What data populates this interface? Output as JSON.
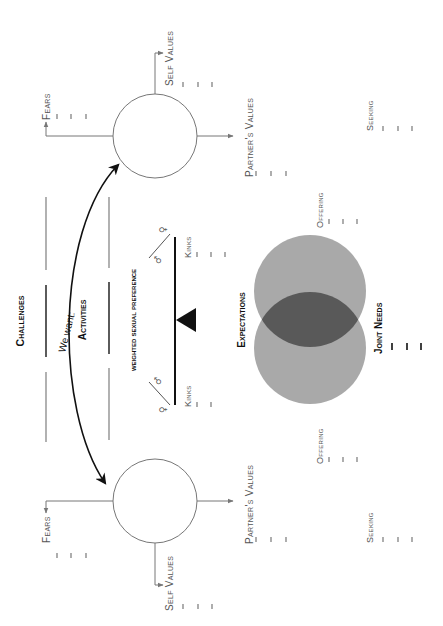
{
  "orientation": "rotated -90 degrees",
  "colors": {
    "venn_light": "#a9a9a9",
    "venn_overlap": "#595959",
    "line": "#777777",
    "dark": "#111111"
  },
  "center": {
    "challenges": "Challenges",
    "activities": "Activities",
    "we_want": "We want:",
    "weighted_preference": "weighted sexual preference",
    "expectations": "Expectations",
    "joint_needs": "Joint Needs",
    "female_symbol": "♀",
    "male_symbol": "♂"
  },
  "partner_a": {
    "fears": "Fears",
    "self_values": "Self Values",
    "partners_values": "Partner's Values",
    "kinks": "Kinks",
    "offering": "Offering",
    "seeking": "Seeking"
  },
  "partner_b": {
    "fears": "Fears",
    "self_values": "Self Values",
    "partners_values": "Partner's Values",
    "kinks": "Kinks",
    "offering": "Offering",
    "seeking": "Seeking"
  }
}
